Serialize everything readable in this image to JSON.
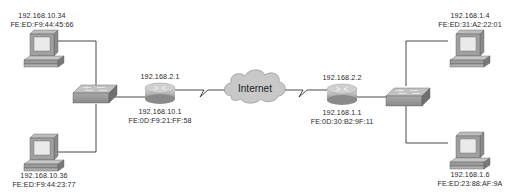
{
  "diagram": {
    "type": "network-topology",
    "cloud": {
      "label": "Internet"
    },
    "hosts": [
      {
        "id": "pc-top-left",
        "ip": "192.168.10.34",
        "mac": "FE:ED:F9:44:45:66"
      },
      {
        "id": "pc-bottom-left",
        "ip": "192.168.10.36",
        "mac": "FE:ED:F9:44:23:77"
      },
      {
        "id": "pc-top-right",
        "ip": "192.168.1.4",
        "mac": "FE:ED:31:A2:22:01"
      },
      {
        "id": "pc-bottom-right",
        "ip": "192.168.1.6",
        "mac": "FE:ED:23:88:AF:9A"
      }
    ],
    "routers": [
      {
        "id": "router-left",
        "wan_ip": "192.168.2.1",
        "lan_ip": "192.168.10.1",
        "mac": "FE:0D:F9:21:FF:58"
      },
      {
        "id": "router-right",
        "wan_ip": "192.168.2.2",
        "lan_ip": "192.168.1.1",
        "mac": "FE:0D:30:B2:9F:11"
      }
    ],
    "switches": [
      {
        "id": "switch-left"
      },
      {
        "id": "switch-right"
      }
    ],
    "colors": {
      "line": "#1a1a1a",
      "device_gray": "#9a9a9a",
      "cloud_fill": "#c8c8c8"
    }
  }
}
